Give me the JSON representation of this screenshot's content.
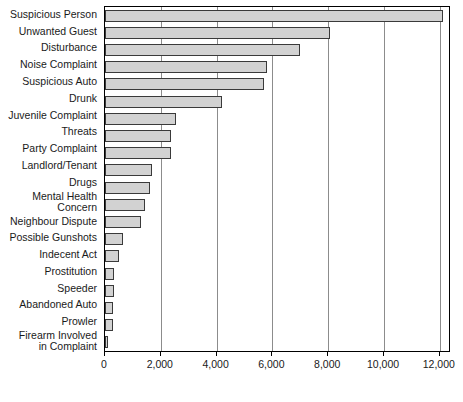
{
  "chart_data": {
    "type": "bar",
    "orientation": "horizontal",
    "title": "",
    "subtitle": "",
    "xlabel": "",
    "ylabel": "",
    "xlim": [
      0,
      12400
    ],
    "xticks": [
      0,
      2000,
      4000,
      6000,
      8000,
      10000,
      12000
    ],
    "xtick_labels": [
      "0",
      "2,000",
      "4,000",
      "6,000",
      "8,000",
      "10,000",
      "12,000"
    ],
    "grid": true,
    "grid_axis": "x",
    "legend": false,
    "legend_position": "none",
    "bar_fill_color": "#d2d2d2",
    "bar_edge_color": "#3a3a3a",
    "categories": [
      "Suspicious Person",
      "Unwanted Guest",
      "Disturbance",
      "Noise Complaint",
      "Suspicious Auto",
      "Drunk",
      "Juvenile Complaint",
      "Threats",
      "Party Complaint",
      "Landlord/Tenant",
      "Drugs",
      "Mental Health\nConcern",
      "Neighbour Dispute",
      "Possible Gunshots",
      "Indecent Act",
      "Prostitution",
      "Speeder",
      "Abandoned Auto",
      "Prowler",
      "Firearm Involved\nin Complaint"
    ],
    "values": [
      12100,
      8050,
      7000,
      5800,
      5700,
      4200,
      2550,
      2350,
      2350,
      1700,
      1600,
      1450,
      1300,
      640,
      500,
      330,
      330,
      280,
      280,
      100
    ]
  }
}
